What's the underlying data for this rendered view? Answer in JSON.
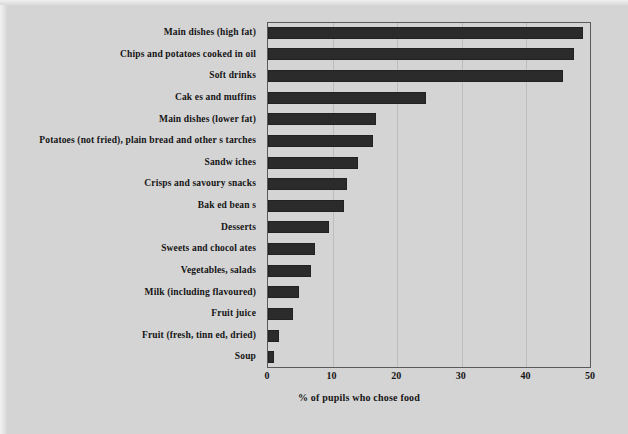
{
  "chart_data": {
    "type": "bar",
    "orientation": "horizontal",
    "title": "",
    "xlabel": "% of pupils who chose food",
    "ylabel": "",
    "xlim": [
      0,
      50
    ],
    "xticks": [
      0,
      10,
      20,
      30,
      40,
      50
    ],
    "grid": true,
    "legend": false,
    "bar_color": "#2b2b2b",
    "background_color": "#d4d4d4",
    "categories": [
      "Main dishes (high fat)",
      "Chips and potatoes  cooked in oil",
      "Soft drinks",
      "Cak es and  muffins",
      "Main dishes (lower fat)",
      "Potatoes (not fried), plain bread  and other s tarches",
      "Sandw iches",
      "Crisps and savoury  snacks",
      "Bak ed bean s",
      "Desserts",
      "Sweets and chocol ates",
      "Vegetables,  salads",
      "Milk (including flavoured)",
      "Fruit juice",
      "Fruit  (fresh, tinn ed, dried)",
      "Soup"
    ],
    "values": [
      48.7,
      47.4,
      45.6,
      24.5,
      16.7,
      16.3,
      14.0,
      12.2,
      11.8,
      9.4,
      7.3,
      6.7,
      4.8,
      3.8,
      1.7,
      0.9
    ]
  }
}
